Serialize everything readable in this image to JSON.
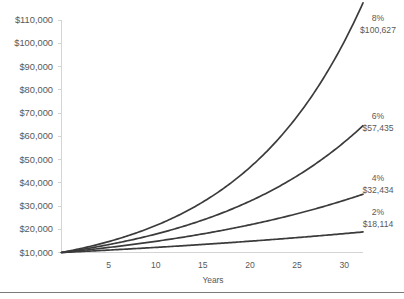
{
  "chart_data": {
    "type": "line",
    "title": "",
    "xlabel": "Years",
    "ylabel": "",
    "xlim": [
      0,
      32
    ],
    "ylim": [
      10000,
      110000
    ],
    "grid": false,
    "legend_position": "right-annotations",
    "x_ticks": [
      "5",
      "10",
      "15",
      "20",
      "25",
      "30"
    ],
    "x_tick_values": [
      5,
      10,
      15,
      20,
      25,
      30
    ],
    "y_ticks": [
      "$10,000",
      "$20,000",
      "$30,000",
      "$40,000",
      "$50,000",
      "$60,000",
      "$70,000",
      "$80,000",
      "$90,000",
      "$100,000",
      "$110,000"
    ],
    "y_tick_values": [
      10000,
      20000,
      30000,
      40000,
      50000,
      60000,
      70000,
      80000,
      90000,
      100000,
      110000
    ],
    "principal": 10000,
    "x": [
      0,
      2,
      4,
      6,
      8,
      10,
      12,
      14,
      16,
      18,
      20,
      22,
      24,
      26,
      28,
      30,
      32
    ],
    "series": [
      {
        "name": "8%",
        "rate_label": "8%",
        "end_value_label": "$100,627",
        "end_value": 100627,
        "color": "#3b3b3b",
        "values": [
          10000,
          11664,
          13605,
          15869,
          18509,
          21589,
          25182,
          29372,
          34259,
          39960,
          46610,
          54365,
          63412,
          73964,
          86271,
          100627,
          117376
        ]
      },
      {
        "name": "6%",
        "rate_label": "6%",
        "end_value_label": "$57,435",
        "end_value": 57435,
        "color": "#3b3b3b",
        "values": [
          10000,
          11236,
          12625,
          14185,
          15938,
          17908,
          20122,
          22609,
          25404,
          28543,
          32071,
          36035,
          40489,
          45494,
          51117,
          57435,
          64534
        ]
      },
      {
        "name": "4%",
        "rate_label": "4%",
        "end_value_label": "$32,434",
        "end_value": 32434,
        "color": "#3b3b3b",
        "values": [
          10000,
          10816,
          11699,
          12653,
          13686,
          14802,
          16010,
          17317,
          18730,
          20258,
          21911,
          23699,
          25633,
          27725,
          29987,
          32434,
          35081
        ]
      },
      {
        "name": "2%",
        "rate_label": "2%",
        "end_value_label": "$18,114",
        "end_value": 18114,
        "color": "#3b3b3b",
        "values": [
          10000,
          10404,
          10824,
          11262,
          11717,
          12190,
          12682,
          13195,
          13728,
          14282,
          14859,
          15460,
          16084,
          16734,
          17410,
          18114,
          18845
        ]
      }
    ],
    "annotations": [
      {
        "rate": "8%",
        "value": "$100,627"
      },
      {
        "rate": "6%",
        "value": "$57,435"
      },
      {
        "rate": "4%",
        "value": "$32,434"
      },
      {
        "rate": "2%",
        "value": "$18,114"
      }
    ]
  }
}
